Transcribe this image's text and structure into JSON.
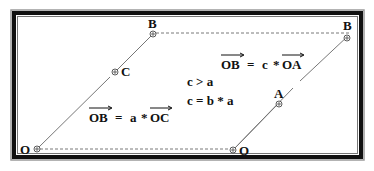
{
  "diagram": {
    "left_figure": {
      "points": [
        {
          "id": "O",
          "label": "O"
        },
        {
          "id": "C",
          "label": "C"
        },
        {
          "id": "B",
          "label": "B"
        }
      ],
      "equation": {
        "lhs_vector": "OB",
        "operator": "=",
        "scalar": "a",
        "mult": "*",
        "rhs_vector": "OC"
      }
    },
    "right_figure": {
      "points": [
        {
          "id": "O",
          "label": "O"
        },
        {
          "id": "A",
          "label": "A"
        },
        {
          "id": "B",
          "label": "B"
        }
      ],
      "equation": {
        "lhs_vector": "OB",
        "operator": "=",
        "scalar": "c",
        "mult": "*",
        "rhs_vector": "OA"
      }
    },
    "relations": [
      "c > a",
      "c = b * a"
    ]
  }
}
